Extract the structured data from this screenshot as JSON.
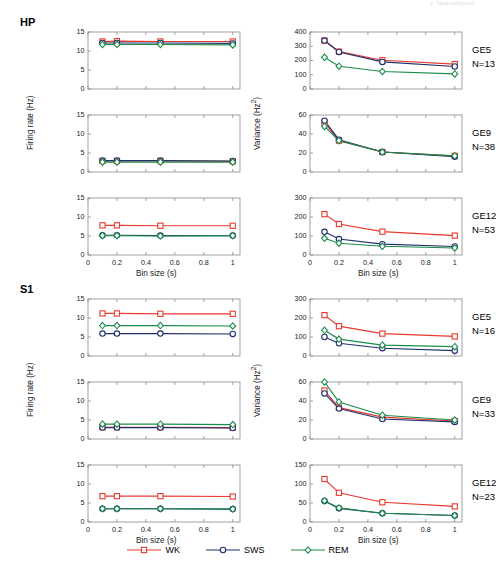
{
  "running_header": "J. Neurophysiol.",
  "blocks": [
    {
      "id": "HP",
      "label": "HP"
    },
    {
      "id": "S1",
      "label": "S1"
    }
  ],
  "legend": {
    "position": "bottom-center",
    "items": [
      {
        "key": "WK",
        "label": "WK",
        "color": "#e8392f",
        "marker": "square"
      },
      {
        "key": "SWS",
        "label": "SWS",
        "color": "#1f2f6e",
        "marker": "circle"
      },
      {
        "key": "REM",
        "label": "REM",
        "color": "#1a8c4a",
        "marker": "diamond"
      }
    ]
  },
  "axis_titles": {
    "x": "Bin size (s)",
    "y_left": "Firing rate (Hz)",
    "y_right": "Variance (Hz²)"
  },
  "x_ticks": [
    "0",
    "0.2",
    "0.4",
    "0.6",
    "0.8",
    "1"
  ],
  "row_labels": [
    {
      "name": "GE5",
      "n": "N=13"
    },
    {
      "name": "GE9",
      "n": "N=38"
    },
    {
      "name": "GE12",
      "n": "N=53"
    },
    {
      "name": "GE5",
      "n": "N=16"
    },
    {
      "name": "GE9",
      "n": "N=33"
    },
    {
      "name": "GE12",
      "n": "N=23"
    }
  ],
  "chart_data": [
    {
      "id": "hp-ge5-rate",
      "type": "line",
      "region": "HP",
      "subject": "GE5",
      "n": 13,
      "title": "",
      "xlabel": "Bin size (s)",
      "ylabel": "Firing rate (Hz)",
      "x": [
        0.1,
        0.2,
        0.5,
        1
      ],
      "xlim": [
        0,
        1.05
      ],
      "ylim": [
        0,
        15
      ],
      "yticks": [
        0,
        5,
        10,
        15
      ],
      "grid": false,
      "series": [
        {
          "name": "WK",
          "values": [
            12.5,
            12.6,
            12.5,
            12.5
          ]
        },
        {
          "name": "SWS",
          "values": [
            12.1,
            12.1,
            12.1,
            12.0
          ]
        },
        {
          "name": "REM",
          "values": [
            11.7,
            11.7,
            11.7,
            11.6
          ]
        }
      ]
    },
    {
      "id": "hp-ge5-var",
      "type": "line",
      "region": "HP",
      "subject": "GE5",
      "n": 13,
      "title": "",
      "xlabel": "Bin size (s)",
      "ylabel": "Variance (Hz²)",
      "x": [
        0.1,
        0.2,
        0.5,
        1
      ],
      "xlim": [
        0,
        1.05
      ],
      "ylim": [
        0,
        400
      ],
      "yticks": [
        0,
        100,
        200,
        300,
        400
      ],
      "grid": false,
      "series": [
        {
          "name": "WK",
          "values": [
            340,
            262,
            202,
            175
          ]
        },
        {
          "name": "SWS",
          "values": [
            340,
            260,
            190,
            158
          ]
        },
        {
          "name": "REM",
          "values": [
            222,
            160,
            123,
            106
          ]
        }
      ]
    },
    {
      "id": "hp-ge9-rate",
      "type": "line",
      "region": "HP",
      "subject": "GE9",
      "n": 38,
      "title": "",
      "xlabel": "Bin size (s)",
      "ylabel": "Firing rate (Hz)",
      "x": [
        0.1,
        0.2,
        0.5,
        1
      ],
      "xlim": [
        0,
        1.05
      ],
      "ylim": [
        0,
        15
      ],
      "yticks": [
        0,
        5,
        10,
        15
      ],
      "grid": false,
      "series": [
        {
          "name": "WK",
          "values": [
            2.9,
            2.9,
            2.9,
            2.8
          ]
        },
        {
          "name": "SWS",
          "values": [
            3.0,
            3.0,
            3.0,
            2.9
          ]
        },
        {
          "name": "REM",
          "values": [
            2.6,
            2.6,
            2.6,
            2.6
          ]
        }
      ]
    },
    {
      "id": "hp-ge9-var",
      "type": "line",
      "region": "HP",
      "subject": "GE9",
      "n": 38,
      "title": "",
      "xlabel": "Bin size (s)",
      "ylabel": "Variance (Hz²)",
      "x": [
        0.1,
        0.2,
        0.5,
        1
      ],
      "xlim": [
        0,
        1.05
      ],
      "ylim": [
        0,
        60
      ],
      "yticks": [
        0,
        20,
        40,
        60
      ],
      "grid": false,
      "series": [
        {
          "name": "WK",
          "values": [
            52,
            33,
            21,
            17
          ]
        },
        {
          "name": "SWS",
          "values": [
            54,
            34,
            21,
            16
          ]
        },
        {
          "name": "REM",
          "values": [
            48,
            33,
            21,
            17
          ]
        }
      ]
    },
    {
      "id": "hp-ge12-rate",
      "type": "line",
      "region": "HP",
      "subject": "GE12",
      "n": 53,
      "title": "",
      "xlabel": "Bin size (s)",
      "ylabel": "Firing rate (Hz)",
      "x": [
        0.1,
        0.2,
        0.5,
        1
      ],
      "xlim": [
        0,
        1.05
      ],
      "ylim": [
        0,
        15
      ],
      "yticks": [
        0,
        5,
        10,
        15
      ],
      "grid": false,
      "series": [
        {
          "name": "WK",
          "values": [
            7.8,
            7.8,
            7.7,
            7.7
          ]
        },
        {
          "name": "SWS",
          "values": [
            5.2,
            5.2,
            5.1,
            5.1
          ]
        },
        {
          "name": "REM",
          "values": [
            5.1,
            5.1,
            5.0,
            5.1
          ]
        }
      ]
    },
    {
      "id": "hp-ge12-var",
      "type": "line",
      "region": "HP",
      "subject": "GE12",
      "n": 53,
      "title": "",
      "xlabel": "Bin size (s)",
      "ylabel": "Variance (Hz²)",
      "x": [
        0.1,
        0.2,
        0.5,
        1
      ],
      "xlim": [
        0,
        1.05
      ],
      "ylim": [
        0,
        300
      ],
      "yticks": [
        0,
        100,
        200,
        300
      ],
      "grid": false,
      "series": [
        {
          "name": "WK",
          "values": [
            215,
            163,
            123,
            102
          ]
        },
        {
          "name": "SWS",
          "values": [
            122,
            84,
            57,
            45
          ]
        },
        {
          "name": "REM",
          "values": [
            88,
            62,
            46,
            37
          ]
        }
      ]
    },
    {
      "id": "s1-ge5-rate",
      "type": "line",
      "region": "S1",
      "subject": "GE5",
      "n": 16,
      "title": "",
      "xlabel": "Bin size (s)",
      "ylabel": "Firing rate (Hz)",
      "x": [
        0.1,
        0.2,
        0.5,
        1
      ],
      "xlim": [
        0,
        1.05
      ],
      "ylim": [
        0,
        15
      ],
      "yticks": [
        0,
        5,
        10,
        15
      ],
      "grid": false,
      "series": [
        {
          "name": "WK",
          "values": [
            11.2,
            11.2,
            11.1,
            11.1
          ]
        },
        {
          "name": "SWS",
          "values": [
            5.9,
            5.9,
            5.9,
            5.8
          ]
        },
        {
          "name": "REM",
          "values": [
            8.0,
            8.0,
            8.0,
            7.9
          ]
        }
      ]
    },
    {
      "id": "s1-ge5-var",
      "type": "line",
      "region": "S1",
      "subject": "GE5",
      "n": 16,
      "title": "",
      "xlabel": "Bin size (s)",
      "ylabel": "Variance (Hz²)",
      "x": [
        0.1,
        0.2,
        0.5,
        1
      ],
      "xlim": [
        0,
        1.05
      ],
      "ylim": [
        0,
        300
      ],
      "yticks": [
        0,
        100,
        200,
        300
      ],
      "grid": false,
      "series": [
        {
          "name": "WK",
          "values": [
            215,
            157,
            118,
            103
          ]
        },
        {
          "name": "SWS",
          "values": [
            100,
            67,
            41,
            28
          ]
        },
        {
          "name": "REM",
          "values": [
            135,
            89,
            57,
            49
          ]
        }
      ]
    },
    {
      "id": "s1-ge9-rate",
      "type": "line",
      "region": "S1",
      "subject": "GE9",
      "n": 33,
      "title": "",
      "xlabel": "Bin size (s)",
      "ylabel": "Firing rate (Hz)",
      "x": [
        0.1,
        0.2,
        0.5,
        1
      ],
      "xlim": [
        0,
        1.05
      ],
      "ylim": [
        0,
        15
      ],
      "yticks": [
        0,
        5,
        10,
        15
      ],
      "grid": false,
      "series": [
        {
          "name": "WK",
          "values": [
            3.1,
            3.1,
            3.1,
            3.0
          ]
        },
        {
          "name": "SWS",
          "values": [
            3.0,
            3.0,
            3.0,
            2.9
          ]
        },
        {
          "name": "REM",
          "values": [
            3.9,
            3.9,
            3.9,
            3.8
          ]
        }
      ]
    },
    {
      "id": "s1-ge9-var",
      "type": "line",
      "region": "S1",
      "subject": "GE9",
      "n": 33,
      "title": "",
      "xlabel": "Bin size (s)",
      "ylabel": "Variance (Hz²)",
      "x": [
        0.1,
        0.2,
        0.5,
        1
      ],
      "xlim": [
        0,
        1.05
      ],
      "ylim": [
        0,
        60
      ],
      "yticks": [
        0,
        20,
        40,
        60
      ],
      "grid": false,
      "series": [
        {
          "name": "WK",
          "values": [
            51,
            33,
            23,
            19
          ]
        },
        {
          "name": "SWS",
          "values": [
            48,
            32,
            21,
            18
          ]
        },
        {
          "name": "REM",
          "values": [
            60,
            39,
            25,
            20
          ]
        }
      ]
    },
    {
      "id": "s1-ge12-rate",
      "type": "line",
      "region": "S1",
      "subject": "GE12",
      "n": 23,
      "title": "",
      "xlabel": "Bin size (s)",
      "ylabel": "Firing rate (Hz)",
      "x": [
        0.1,
        0.2,
        0.5,
        1
      ],
      "xlim": [
        0,
        1.05
      ],
      "ylim": [
        0,
        15
      ],
      "yticks": [
        0,
        5,
        10,
        15
      ],
      "grid": false,
      "series": [
        {
          "name": "WK",
          "values": [
            6.8,
            6.8,
            6.8,
            6.7
          ]
        },
        {
          "name": "SWS",
          "values": [
            3.5,
            3.5,
            3.5,
            3.4
          ]
        },
        {
          "name": "REM",
          "values": [
            3.5,
            3.5,
            3.5,
            3.4
          ]
        }
      ]
    },
    {
      "id": "s1-ge12-var",
      "type": "line",
      "region": "S1",
      "subject": "GE12",
      "n": 23,
      "title": "",
      "xlabel": "Bin size (s)",
      "ylabel": "Variance (Hz²)",
      "x": [
        0.1,
        0.2,
        0.5,
        1
      ],
      "xlim": [
        0,
        1.05
      ],
      "ylim": [
        0,
        150
      ],
      "yticks": [
        0,
        50,
        100,
        150
      ],
      "grid": false,
      "series": [
        {
          "name": "WK",
          "values": [
            113,
            77,
            52,
            41
          ]
        },
        {
          "name": "SWS",
          "values": [
            55,
            36,
            23,
            17
          ]
        },
        {
          "name": "REM",
          "values": [
            56,
            37,
            23,
            17
          ]
        }
      ]
    }
  ]
}
